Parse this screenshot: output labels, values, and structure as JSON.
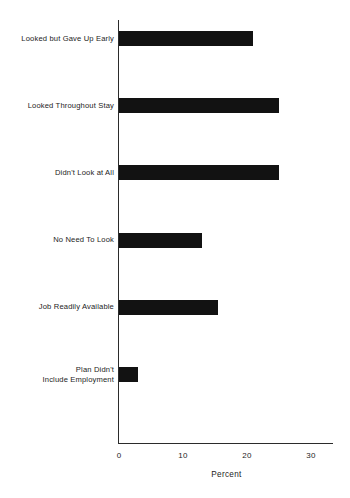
{
  "chart_data": {
    "type": "bar",
    "orientation": "horizontal",
    "title": "",
    "xlabel": "Percent",
    "ylabel": "",
    "xlim": [
      0,
      33
    ],
    "xticks": [
      0,
      10,
      20,
      30
    ],
    "xtick_labels": [
      "0",
      "10",
      "20",
      "30"
    ],
    "grid": false,
    "legend": false,
    "bar_color": "#121212",
    "axis_color": "#2b2b2b",
    "background": "#ffffff",
    "categories": [
      "Looked but Gave Up Early",
      "Looked Throughout Stay",
      "Didn't Look at All",
      "No Need To Look",
      "Job Readily Available",
      "Plan Didn't\nInclude Employment"
    ],
    "values": [
      21,
      25,
      25,
      13,
      15.5,
      3
    ],
    "bars": [
      {
        "label": "Looked but Gave Up Early",
        "value": 21
      },
      {
        "label": "Looked Throughout Stay",
        "value": 25
      },
      {
        "label": "Didn't Look at All",
        "value": 25
      },
      {
        "label": "No Need To Look",
        "value": 13
      },
      {
        "label": "Job Readily Available",
        "value": 15.5
      },
      {
        "label": "Plan Didn't\nInclude Employment",
        "value": 3
      }
    ]
  }
}
